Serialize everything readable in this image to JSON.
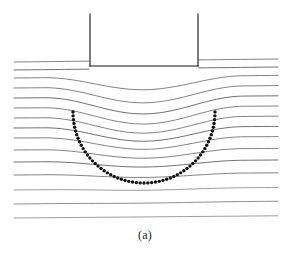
{
  "figure": {
    "caption": "(a)",
    "type": "soil-displacement-field-diagram",
    "colors": {
      "background": "#ffffff",
      "line": "#2b2b2b",
      "footing": "#141414",
      "dot": "#111111",
      "caption": "#1a1a1a"
    },
    "footing": {
      "name": "strip-footing",
      "left_x": 90,
      "right_x": 198,
      "top_y": 14,
      "base_y": 66,
      "stroke_width": 1.1
    },
    "slip_circle": {
      "name": "dotted-slip-surface",
      "center_x": 144,
      "center_y": 112,
      "radius_x": 71,
      "radius_y": 71,
      "start_angle_deg": 180,
      "end_angle_deg": 360,
      "dot_count": 58,
      "dot_radius": 1.7
    },
    "ground_lines": {
      "count": 15,
      "x_start": 14,
      "x_end": 278,
      "baseline_y": [
        62,
        70,
        78,
        88,
        98,
        108,
        118,
        128,
        138,
        150,
        162,
        175,
        190,
        204,
        218
      ],
      "tilt": [
        -3.0,
        -3.0,
        -2.6,
        -2.4,
        -2.2,
        -2.0,
        -1.8,
        -1.6,
        -1.4,
        -1.6,
        -2.0,
        -2.2,
        -2.6,
        -2.8,
        -2.2
      ],
      "dip_amplitude": [
        0,
        0,
        13,
        16,
        17,
        17,
        16,
        14,
        12,
        9,
        6,
        3.5,
        1.5,
        0.5,
        0
      ],
      "dip_center_x": 144,
      "dip_half_width": 100,
      "break_at_footing": [
        true,
        true,
        false,
        false,
        false,
        false,
        false,
        false,
        false,
        false,
        false,
        false,
        false,
        false,
        false
      ]
    }
  }
}
